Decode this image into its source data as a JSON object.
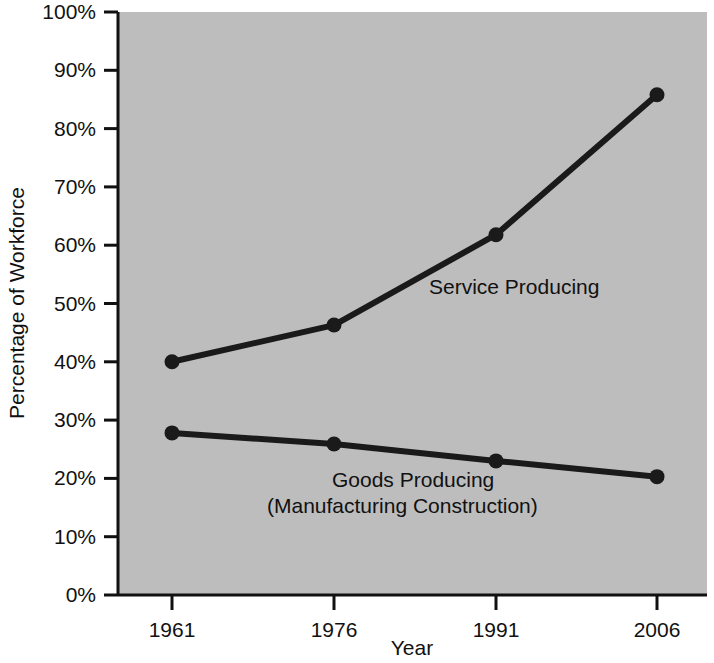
{
  "chart_data": {
    "type": "line",
    "title": "",
    "xlabel": "Year",
    "ylabel": "Percentage of Workforce",
    "x": [
      1961,
      1976,
      1991,
      2006
    ],
    "xtick_labels": [
      "1961",
      "1976",
      "1991",
      "2006"
    ],
    "ytick_labels": [
      "0%",
      "10%",
      "20%",
      "30%",
      "40%",
      "50%",
      "60%",
      "70%",
      "80%",
      "90%",
      "100%"
    ],
    "ytick_values": [
      0,
      10,
      20,
      30,
      40,
      50,
      60,
      70,
      80,
      90,
      100
    ],
    "xlim": [
      1961,
      2006
    ],
    "ylim": [
      0,
      100
    ],
    "grid": false,
    "legend_position": "inline-annotations",
    "plot_background_color": "#bdbdbd",
    "line_color": "#1a1a1a",
    "series": [
      {
        "name": "Service Producing",
        "label": "Service Producing",
        "values": [
          40.0,
          46.3,
          61.8,
          85.8
        ]
      },
      {
        "name": "Goods Producing (Manufacturing Construction)",
        "label_line1": "Goods Producing",
        "label_line2": "(Manufacturing Construction)",
        "values": [
          27.8,
          25.9,
          23.0,
          20.3
        ]
      }
    ],
    "annotations": [
      {
        "text": "Service Producing",
        "x_px": 429,
        "y_px": 294
      },
      {
        "text": "Goods Producing",
        "x_px": 332,
        "y_px": 487
      },
      {
        "text": "(Manufacturing Construction)",
        "x_px": 267,
        "y_px": 513
      }
    ]
  }
}
